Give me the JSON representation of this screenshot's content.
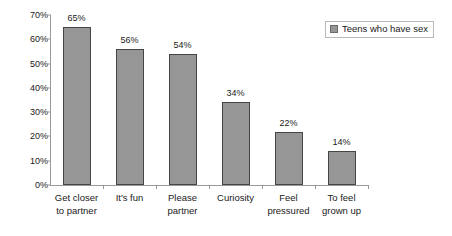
{
  "chart_data": {
    "type": "bar",
    "title": "",
    "subtitle": "",
    "xlabel": "",
    "ylabel": "",
    "categories": [
      "Get closer\nto partner",
      "It's fun",
      "Please\npartner",
      "Curiosity",
      "Feel\npressured",
      "To feel\ngrown up"
    ],
    "values": [
      65,
      56,
      54,
      34,
      22,
      14
    ],
    "data_labels": [
      "65%",
      "56%",
      "54%",
      "34%",
      "22%",
      "14%"
    ],
    "series": [
      {
        "name": "Teens who have sex",
        "values": [
          65,
          56,
          54,
          34,
          22,
          14
        ],
        "color": "#969696"
      }
    ],
    "ylim": [
      0,
      70
    ],
    "ytick_values": [
      0,
      10,
      20,
      30,
      40,
      50,
      60,
      70
    ],
    "ytick_labels": [
      "0%",
      "10%",
      "20%",
      "30%",
      "40%",
      "50%",
      "60%",
      "70%"
    ],
    "grid": false,
    "legend_position": "top-right",
    "legend_entries": [
      "Teens who have sex"
    ],
    "annotations": []
  },
  "legend": {
    "swatch_name": "series-color-swatch",
    "label": "Teens who have sex"
  },
  "colors": {
    "bar_fill": "#969696",
    "bar_border": "#454545",
    "axis": "#9a9a9a",
    "text": "#1a1a1a",
    "legend_border": "#b9b9b9",
    "background": "#ffffff"
  }
}
